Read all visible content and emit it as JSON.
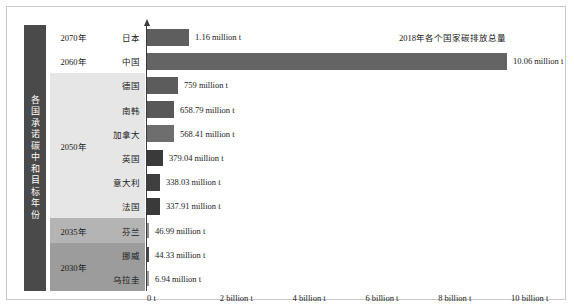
{
  "chart_data": {
    "type": "bar",
    "orientation": "horizontal",
    "title": "2018年各个国家碳排放总量",
    "xlabel": "",
    "ylabel": "",
    "xlim": [
      0,
      10
    ],
    "xtick_labels": [
      "0 t",
      "2 billion t",
      "4 billion t",
      "6 billion t",
      "8 billion t",
      "10 billion t"
    ],
    "xtick_values": [
      0,
      2,
      4,
      6,
      8,
      10
    ],
    "grid": false,
    "legend": "none",
    "categories": [
      "日本",
      "中国",
      "德国",
      "南韩",
      "加拿大",
      "英国",
      "意大利",
      "法国",
      "芬兰",
      "挪威",
      "乌拉圭"
    ],
    "value_labels": [
      "1.16 million t",
      "10.06 million t",
      "759 million t",
      "658.79 million t",
      "568.41 million t",
      "379.04 million t",
      "338.03 million t",
      "337.91 million t",
      "46.99 million t",
      "44.33 million t",
      "6.94 million t"
    ],
    "values": [
      1.16,
      10.06,
      759,
      658.79,
      568.41,
      379.04,
      338.03,
      337.91,
      46.99,
      44.33,
      6.94
    ],
    "bar_pixel_widths": [
      42,
      360,
      31,
      27,
      27,
      16,
      13,
      13,
      2,
      2,
      2
    ],
    "bar_colors": [
      "#5e5e5e",
      "#646464",
      "#5c5c5c",
      "#585858",
      "#6e6e6e",
      "#3a3a3a",
      "#3f3f3f",
      "#3a3a3a",
      "#8c8c8c",
      "#4a4a4a",
      "#9a9a9a"
    ],
    "rows": [
      {
        "country": "日本",
        "year": "2070年",
        "label": "1.16 million t",
        "value": 1.16,
        "w": 42,
        "color": "#5e5e5e"
      },
      {
        "country": "中国",
        "year": "2060年",
        "label": "10.06 million t",
        "value": 10.06,
        "w": 360,
        "color": "#646464"
      },
      {
        "country": "德国",
        "year": "2050年",
        "label": "759 million t",
        "value": 759,
        "w": 31,
        "color": "#5c5c5c"
      },
      {
        "country": "南韩",
        "year": "2050年",
        "label": "658.79 million t",
        "value": 658.79,
        "w": 27,
        "color": "#585858"
      },
      {
        "country": "加拿大",
        "year": "2050年",
        "label": "568.41 million t",
        "value": 568.41,
        "w": 27,
        "color": "#6e6e6e"
      },
      {
        "country": "英国",
        "year": "2050年",
        "label": "379.04 million t",
        "value": 379.04,
        "w": 16,
        "color": "#3a3a3a"
      },
      {
        "country": "意大利",
        "year": "2050年",
        "label": "338.03 million t",
        "value": 338.03,
        "w": 13,
        "color": "#3f3f3f"
      },
      {
        "country": "法国",
        "year": "2050年",
        "label": "337.91 million t",
        "value": 337.91,
        "w": 13,
        "color": "#3a3a3a"
      },
      {
        "country": "芬兰",
        "year": "2035年",
        "label": "46.99 million t",
        "value": 46.99,
        "w": 2,
        "color": "#8c8c8c"
      },
      {
        "country": "挪威",
        "year": "2030年",
        "label": "44.33 million t",
        "value": 44.33,
        "w": 2,
        "color": "#4a4a4a"
      },
      {
        "country": "乌拉圭",
        "year": "2030年",
        "label": "6.94 million t",
        "value": 6.94,
        "w": 2,
        "color": "#9a9a9a"
      }
    ]
  },
  "sidebar": {
    "vertical_label": "各国承诺碳中和目标年份",
    "vertical_label_chars": [
      "各",
      "国",
      "承",
      "诺",
      "碳",
      "中",
      "和",
      "目",
      "标",
      "年",
      "份"
    ],
    "background_color": "#4a4a4a",
    "text_color": "#ffffff"
  },
  "year_groups": [
    {
      "label": "2070年",
      "rows": 1,
      "background": "#ffffff"
    },
    {
      "label": "2060年",
      "rows": 1,
      "background": "#ffffff"
    },
    {
      "label": "2050年",
      "rows": 6,
      "background": "#e6e6e6"
    },
    {
      "label": "2035年",
      "rows": 1,
      "background": "#b4b4b4"
    },
    {
      "label": "2030年",
      "rows": 2,
      "background": "#9c9c9c"
    }
  ],
  "axis": {
    "line_color": "#3a3a3a",
    "arrow": "up-arrow-icon"
  },
  "frame": {
    "border_color": "#c9c9c9",
    "background": "#ffffff"
  }
}
